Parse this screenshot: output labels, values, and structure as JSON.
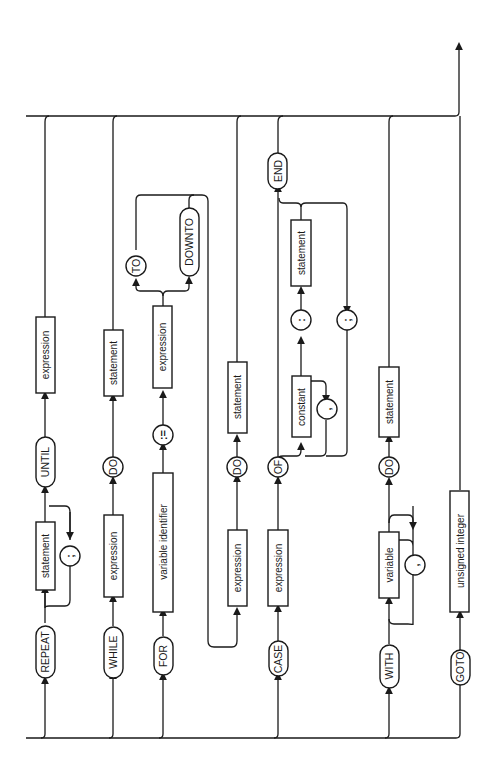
{
  "diagram": {
    "type": "syntax-diagram",
    "orientation": "rotated-90-ccw",
    "colors": {
      "ink": "#1a1a1a",
      "background": "#ffffff"
    },
    "branches": [
      {
        "name": "repeat",
        "elements": [
          {
            "kind": "keyword",
            "label": "REPEAT"
          },
          {
            "kind": "nonterminal",
            "label": "statement"
          },
          {
            "kind": "symbol",
            "label": ";"
          },
          {
            "kind": "keyword",
            "label": "UNTIL"
          },
          {
            "kind": "nonterminal",
            "label": "expression"
          }
        ]
      },
      {
        "name": "while",
        "elements": [
          {
            "kind": "keyword",
            "label": "WHILE"
          },
          {
            "kind": "nonterminal",
            "label": "expression"
          },
          {
            "kind": "keyword",
            "label": "DO"
          },
          {
            "kind": "nonterminal",
            "label": "statement"
          }
        ]
      },
      {
        "name": "for",
        "elements": [
          {
            "kind": "keyword",
            "label": "FOR"
          },
          {
            "kind": "nonterminal",
            "label": "variable identifier"
          },
          {
            "kind": "symbol",
            "label": ":="
          },
          {
            "kind": "nonterminal",
            "label": "expression"
          },
          {
            "kind": "keyword",
            "label": "TO"
          },
          {
            "kind": "keyword",
            "label": "DOWNTO"
          },
          {
            "kind": "nonterminal",
            "label": "expression"
          },
          {
            "kind": "keyword",
            "label": "DO"
          },
          {
            "kind": "nonterminal",
            "label": "statement"
          }
        ]
      },
      {
        "name": "case",
        "elements": [
          {
            "kind": "keyword",
            "label": "CASE"
          },
          {
            "kind": "nonterminal",
            "label": "expression"
          },
          {
            "kind": "keyword",
            "label": "OF"
          },
          {
            "kind": "nonterminal",
            "label": "constant"
          },
          {
            "kind": "symbol",
            "label": ","
          },
          {
            "kind": "symbol",
            "label": ":"
          },
          {
            "kind": "nonterminal",
            "label": "statement"
          },
          {
            "kind": "symbol",
            "label": ";"
          },
          {
            "kind": "keyword",
            "label": "END"
          }
        ]
      },
      {
        "name": "with",
        "elements": [
          {
            "kind": "keyword",
            "label": "WITH"
          },
          {
            "kind": "nonterminal",
            "label": "variable"
          },
          {
            "kind": "symbol",
            "label": ","
          },
          {
            "kind": "keyword",
            "label": "DO"
          },
          {
            "kind": "nonterminal",
            "label": "statement"
          }
        ]
      },
      {
        "name": "goto",
        "elements": [
          {
            "kind": "keyword",
            "label": "GOTO"
          },
          {
            "kind": "nonterminal",
            "label": "unsigned integer"
          }
        ]
      }
    ]
  },
  "labels": {
    "repeat": "REPEAT",
    "rep_stmt": "statement",
    "rep_semi": ";",
    "until": "UNTIL",
    "rep_expr": "expression",
    "while": "WHILE",
    "wh_expr": "expression",
    "wh_do": "DO",
    "wh_stmt": "statement",
    "for": "FOR",
    "for_var": "variable identifier",
    "for_assign": ":=",
    "for_expr1": "expression",
    "for_to": "TO",
    "for_downto": "DOWNTO",
    "for_expr2": "expression",
    "for_do": "DO",
    "for_stmt": "statement",
    "case": "CASE",
    "case_expr": "expression",
    "case_of": "OF",
    "case_const": "constant",
    "case_comma": ",",
    "case_colon": ":",
    "case_stmt": "statement",
    "case_semi": ";",
    "case_end": "END",
    "with": "WITH",
    "with_var": "variable",
    "with_comma": ",",
    "with_do": "DO",
    "with_stmt": "statement",
    "goto": "GOTO",
    "goto_int": "unsigned integer"
  }
}
